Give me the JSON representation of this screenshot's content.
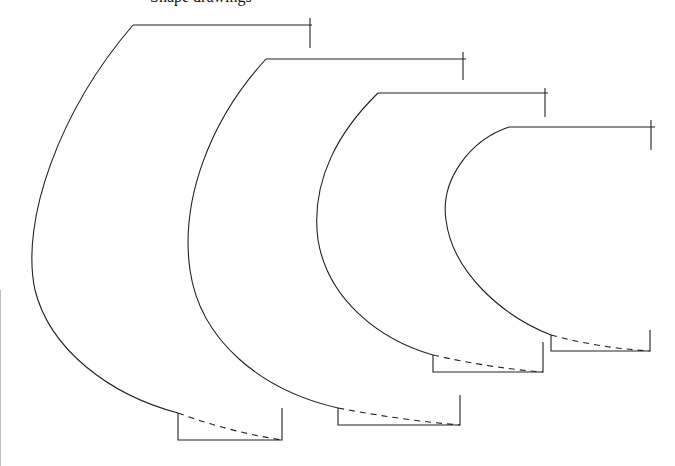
{
  "caption": "Shape drawings",
  "colors": {
    "stroke": "#222222",
    "background": "#ffffff",
    "edge": "#bdbdbd"
  },
  "shapes": [
    {
      "id": "shape-1",
      "curve": "M133,25 C60,110 20,220 35,290 C50,350 110,395 178,413",
      "top_line": [
        [
          133,
          25
        ],
        [
          312,
          25
        ]
      ],
      "tick": [
        [
          310,
          18
        ],
        [
          310,
          48
        ]
      ],
      "box": "M178,413 L178,440 L282,440 L282,408",
      "dashed": "M178,413 Q230,432 282,440"
    },
    {
      "id": "shape-2",
      "curve": "M266,59 C210,120 180,200 190,270 C200,340 260,390 338,408",
      "top_line": [
        [
          266,
          59
        ],
        [
          466,
          59
        ]
      ],
      "tick": [
        [
          463,
          52
        ],
        [
          463,
          80
        ]
      ],
      "box": "M338,408 L338,425 L460,425 L460,395",
      "dashed": "M338,408 Q400,420 460,425"
    },
    {
      "id": "shape-3",
      "curve": "M378,93 C340,130 310,180 318,240 C328,300 380,340 433,355",
      "top_line": [
        [
          378,
          93
        ],
        [
          548,
          93
        ]
      ],
      "tick": [
        [
          545,
          88
        ],
        [
          545,
          117
        ]
      ],
      "box": "M433,355 L433,372 L543,372 L543,342",
      "dashed": "M433,355 Q490,368 543,372"
    },
    {
      "id": "shape-4",
      "curve": "M509,127 C470,140 440,180 446,220 C452,270 500,315 551,335",
      "top_line": [
        [
          509,
          127
        ],
        [
          655,
          127
        ]
      ],
      "tick": [
        [
          651,
          120
        ],
        [
          651,
          150
        ]
      ],
      "box": "M551,335 L551,351 L650,351 L650,330",
      "dashed": "M551,335 Q600,348 650,351"
    }
  ]
}
